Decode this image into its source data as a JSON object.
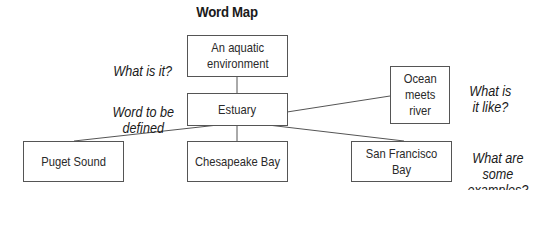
{
  "title": "Word Map",
  "boxes": {
    "definition": "An aquatic\nenvironment",
    "word": "Estuary",
    "description": "Ocean\nmeets\nriver",
    "example_1": "Puget Sound",
    "example_2": "Chesapeake Bay",
    "example_3": "San Francisco\nBay"
  },
  "prompts": {
    "what_is_it": "What is it?",
    "word_to_be_defined": "Word to be\ndefined",
    "what_is_it_like": "What is\nit like?",
    "what_are_examples": "What are\nsome\nexamples?"
  },
  "colors": {
    "line": "#555555",
    "text": "#1a1a1a",
    "background": "#ffffff"
  }
}
